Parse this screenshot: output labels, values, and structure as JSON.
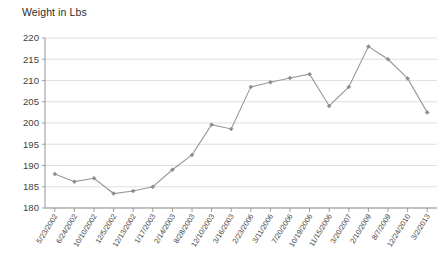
{
  "chart_data": {
    "type": "line",
    "title": "Weight in Lbs",
    "xlabel": "",
    "ylabel": "",
    "ylim": [
      180,
      220
    ],
    "yticks": [
      180,
      185,
      190,
      195,
      200,
      205,
      210,
      215,
      220
    ],
    "grid": true,
    "legend": "none",
    "categories": [
      "5/23/2002",
      "6/24/2002",
      "10/10/2002",
      "12/5/2002",
      "12/13/2002",
      "1/17/2003",
      "2/14/2003",
      "8/28/2003",
      "12/10/2003",
      "3/16/2003",
      "2/23/2006",
      "3/11/2006",
      "7/20/2006",
      "10/19/2006",
      "11/15/2006",
      "3/20/2007",
      "2/10/2009",
      "8/7/2009",
      "12/24/2010",
      "3/2/2013"
    ],
    "values": [
      188.0,
      186.2,
      187.0,
      183.4,
      184.0,
      185.0,
      189.0,
      192.5,
      199.6,
      198.6,
      208.5,
      209.6,
      210.6,
      211.5,
      204.0,
      208.5,
      218.0,
      215.0,
      210.5,
      202.5
    ],
    "series": [
      {
        "name": "Weight in Lbs",
        "color": "#8c8c8c",
        "values": [
          188.0,
          186.2,
          187.0,
          183.4,
          184.0,
          185.0,
          189.0,
          192.5,
          199.6,
          198.6,
          208.5,
          209.6,
          210.6,
          211.5,
          204.0,
          208.5,
          218.0,
          215.0,
          210.5,
          202.5
        ]
      }
    ],
    "colors": {
      "line": "#989898",
      "marker": "#8c8c8c",
      "grid": "#d2d2d2",
      "axis": "#8a8a8a",
      "text": "#3f3f3f"
    }
  }
}
